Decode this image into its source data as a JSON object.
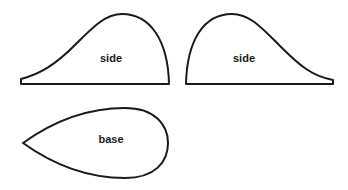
{
  "diagram": {
    "shapes": [
      {
        "id": "side-left",
        "label": "side"
      },
      {
        "id": "side-right",
        "label": "side"
      },
      {
        "id": "base",
        "label": "base"
      }
    ],
    "colors": {
      "stroke": "#1a1a1a",
      "fill": "#ffffff",
      "background": "#ffffff"
    }
  }
}
